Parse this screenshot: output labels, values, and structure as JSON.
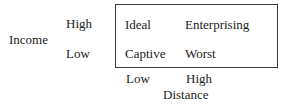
{
  "diagram": {
    "type": "2x2-matrix",
    "y_axis": {
      "title": "Income",
      "high_label": "High",
      "low_label": "Low"
    },
    "x_axis": {
      "title": "Distance",
      "low_label": "Low",
      "high_label": "High"
    },
    "cells": {
      "top_left": "Ideal",
      "top_right": "Enterprising",
      "bottom_left": "Captive",
      "bottom_right": "Worst"
    },
    "colors": {
      "background": "#ffffff",
      "text": "#1b1b1b",
      "border": "#3a3a3a"
    }
  }
}
